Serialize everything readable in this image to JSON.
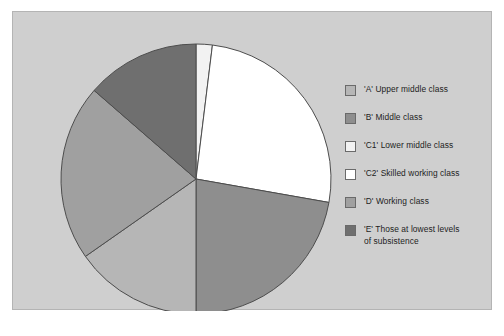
{
  "figure": {
    "background_color": "#cfcfcf",
    "border_color": "#b4b4b4",
    "page_background": "#ffffff"
  },
  "legend": {
    "position": "right",
    "items": [
      {
        "key": "A",
        "label": "'A' Upper middle class",
        "color": "#b6b6b6"
      },
      {
        "key": "B",
        "label": "'B' Middle class",
        "color": "#8e8e8e"
      },
      {
        "key": "C1",
        "label": "'C1' Lower middle class",
        "color": "#f2f2f2"
      },
      {
        "key": "C2",
        "label": "'C2' Skilled working class",
        "color": "#ffffff"
      },
      {
        "key": "D",
        "label": "'D' Working class",
        "color": "#a0a0a0"
      },
      {
        "key": "E",
        "label": "'E' Those at lowest levels\nof subsistence",
        "color": "#6f6f6f"
      }
    ]
  },
  "chart_data": {
    "type": "pie",
    "title": "",
    "subtitle": "",
    "xlabel": "",
    "ylabel": "",
    "grid": false,
    "legend_position": "right",
    "start_angle_deg": 0,
    "direction": "clockwise",
    "center": {
      "x": 183,
      "y": 167
    },
    "radius": 135,
    "stroke_color": "#4d4d4d",
    "categories": [
      "'C1' Lower middle class",
      "'C2' Skilled working class",
      "'B' Middle class",
      "'A' Upper middle class",
      "'D' Working class",
      "'E' Those at lowest levels of subsistence"
    ],
    "keys": [
      "C1",
      "C2",
      "B",
      "A",
      "D",
      "E"
    ],
    "values": [
      2,
      26,
      22,
      15,
      21,
      14
    ],
    "angles_deg": [
      7,
      93,
      80,
      55,
      76,
      49
    ],
    "colors": [
      "#f2f2f2",
      "#ffffff",
      "#8e8e8e",
      "#b6b6b6",
      "#a0a0a0",
      "#6f6f6f"
    ]
  }
}
